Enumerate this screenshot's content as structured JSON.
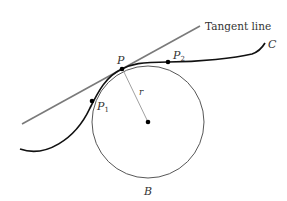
{
  "diagram": {
    "labels": {
      "tangent_line": "Tangent line",
      "curve": "C",
      "point_p": "P",
      "point_p1": "P",
      "point_p1_sub": "1",
      "point_p2": "P",
      "point_p2_sub": "2",
      "radius": "r",
      "circle": "B"
    },
    "colors": {
      "curve": "#111111",
      "tangent_line": "#7a7a7a",
      "circle": "#444444",
      "radius": "#9a9a9a",
      "points": "#000000",
      "text": "#333333"
    },
    "geometry": {
      "tangent_line": {
        "x1": 22,
        "y1": 124,
        "x2": 200,
        "y2": 26
      },
      "circle": {
        "cx": 148,
        "cy": 122,
        "r": 56
      },
      "points": {
        "P": {
          "x": 122,
          "y": 69
        },
        "P1": {
          "x": 92,
          "y": 101
        },
        "P2": {
          "x": 168,
          "y": 62
        },
        "center": {
          "x": 148,
          "y": 122
        }
      }
    }
  }
}
